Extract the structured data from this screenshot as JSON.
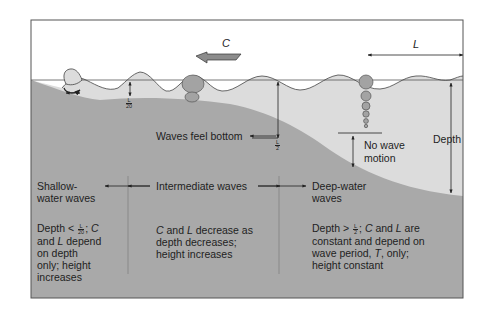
{
  "diagram": {
    "title_symbols": {
      "celerity": "C",
      "wavelength": "L",
      "depth_label": "Depth"
    },
    "markers": {
      "shallow_limit_num": "L",
      "shallow_limit_den": "20",
      "deep_limit_num": "L",
      "deep_limit_den": "2"
    },
    "annotations": {
      "waves_feel_bottom": "Waves feel bottom",
      "no_wave_motion_line1": "No wave",
      "no_wave_motion_line2": "motion"
    },
    "zones": [
      {
        "name": "shallow",
        "title_line1": "Shallow-",
        "title_line2": "water waves",
        "desc_prefix": "Depth <",
        "desc_frac_num": "L",
        "desc_frac_den": "20",
        "desc_after_frac": "; ",
        "desc_c": "C",
        "desc_line2_pre": "and ",
        "desc_line2_l": "L",
        "desc_line2_post": " depend",
        "desc_line3": "on depth",
        "desc_line4": "only; height",
        "desc_line5": "increases"
      },
      {
        "name": "intermediate",
        "title": "Intermediate waves",
        "desc_c": "C",
        "desc_line1_mid": " and ",
        "desc_l": "L",
        "desc_line1_post": " decrease as",
        "desc_line2": "depth decreases;",
        "desc_line3": "height increases"
      },
      {
        "name": "deep",
        "title_line1": "Deep-water",
        "title_line2": "waves",
        "desc_prefix": "Depth >",
        "desc_frac_num": "L",
        "desc_frac_den": "2",
        "desc_after_frac": "; ",
        "desc_c": "C",
        "desc_line1_mid": " and ",
        "desc_l": "L",
        "desc_line1_post": " are",
        "desc_line2": "constant and depend on",
        "desc_line3_pre": "wave period, ",
        "desc_t": "T",
        "desc_line3_post": ", only;",
        "desc_line4": "height constant"
      }
    ],
    "colors": {
      "seafloor": "#a9a9a9",
      "water": "#dcdcdc",
      "orbit": "#a3a3a3",
      "frame": "#555555",
      "arrow_fill": "#8c8c8c"
    }
  }
}
